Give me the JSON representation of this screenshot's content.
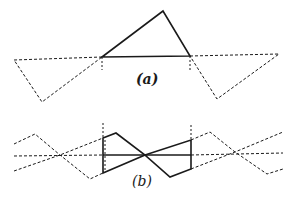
{
  "figure": {
    "panel_a": {
      "label": "(a)"
    },
    "panel_b": {
      "label": "(b)"
    },
    "colors": {
      "ink": "#1a1a1a",
      "paper": "#ffffff"
    }
  }
}
